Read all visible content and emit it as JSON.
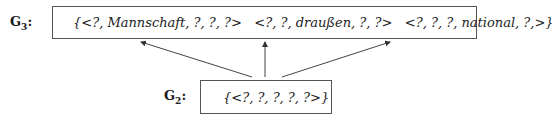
{
  "nodes": {
    "g3": {
      "label_main": "G",
      "label_sub": "3",
      "label_colon": ":",
      "content": "{<?, Mannschaft, ?, ?, ?>   <?, ?, draußen, ?, ?>   <?, ?, ?, national, ?,>}"
    },
    "g2": {
      "label_main": "G",
      "label_sub": "2",
      "label_colon": ":",
      "content": "{<?, ?, ?, ?, ?>}"
    }
  },
  "edges": [
    {
      "from": "g2",
      "to": "g3",
      "position": "left"
    },
    {
      "from": "g2",
      "to": "g3",
      "position": "middle"
    },
    {
      "from": "g2",
      "to": "g3",
      "position": "right"
    }
  ],
  "colors": {
    "line": "#444444",
    "text": "#1a1a1a"
  }
}
